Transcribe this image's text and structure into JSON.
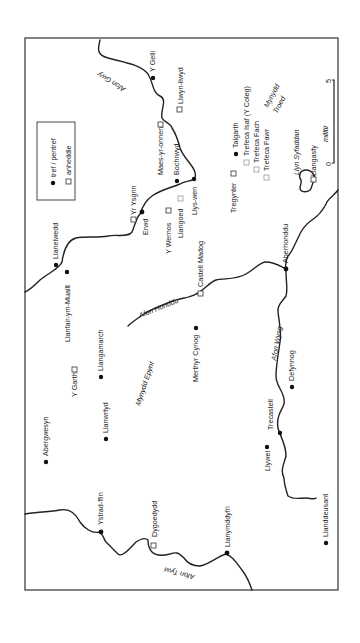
{
  "legend": {
    "town_label": "tref / pentref",
    "hamlet_label": "anheddle"
  },
  "scale": {
    "start": "0",
    "end": "5",
    "unit": "milltir"
  },
  "rivers": {
    "gwy": "Afon Gwy",
    "honddu": "Afon Honddu",
    "wysg": "Afon Wysg",
    "tywi": "Afon Tywi"
  },
  "regions": {
    "mynydd_troed_1": "Mynydd",
    "mynydd_troed_2": "Troed",
    "mynydd_epynt": "Mynydd Epynt",
    "llyn_syfaddan": "Llyn Syfaddan"
  },
  "towns": {
    "y_gelli": "Y Gelli",
    "bochrwyd": "Bochrwyd",
    "llys_wen": "Llys-wen",
    "erwd": "Erwd",
    "talgarth": "Talgarth",
    "llanelwedd": "Llanelwedd",
    "llanfair_ym_muallt": "Llanfair-ym-Muallt",
    "llangamarch": "Llangamarch",
    "llanwrtyd": "Llanwrtyd",
    "abergwesyn": "Abergwesyn",
    "merthyr_cynog": "Merthyr Cynog",
    "aberhonddu": "Aberhonddu",
    "defynnog": "Defynnog",
    "trecastell": "Trecastell",
    "llywel": "Llywel",
    "ystrad_ffin": "Ystrad-ffin",
    "llanymddyfri": "Llanymddyfri",
    "llanddeusant": "Llanddeusant"
  },
  "hamlets": {
    "llwyn_llwyd": "Llwyn-llwyd",
    "maes_yr_onnen": "Maes-yr-onnen",
    "yr_ysgrin": "Yr Ysgrin",
    "y_wernos": "Y Wernos",
    "llangoed": "Llangoed",
    "tregynter": "Tregynter",
    "trefeca_isaf": "Trefeca Isaf (Y Coleg)",
    "trefeca_fach": "Trefeca Fach",
    "trefeca_fawr": "Trefeca Fawr",
    "llangasty": "Llangasty",
    "castell_madog": "Castell Madog",
    "y_garth": "Y Garth",
    "dygoedydd": "Dygoedydd"
  }
}
